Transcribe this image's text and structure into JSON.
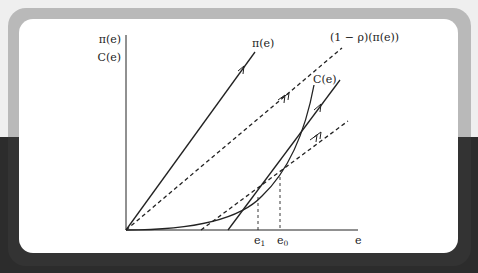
{
  "figure": {
    "y_axis_labels": [
      "π(e)",
      "C(e)"
    ],
    "x_axis_label": "e",
    "curve_labels": {
      "profit": "π(e)",
      "discounted_profit": "(1 − ρ)(π(e))",
      "cost": "C(e)"
    },
    "x_ticks": [
      {
        "base": "e",
        "sub": "1"
      },
      {
        "base": "e",
        "sub": "0"
      }
    ]
  },
  "colors": {
    "background_top": "#efefef",
    "background_bottom": "#2c2c2c",
    "frame_top": "#b9b9b9",
    "frame_bottom": "#333333",
    "card": "#ffffff",
    "ink": "#222222"
  }
}
